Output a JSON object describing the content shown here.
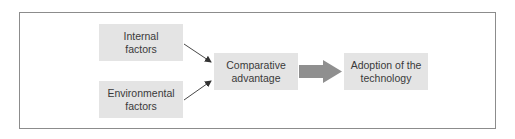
{
  "diagram": {
    "type": "flowchart",
    "nodes": [
      {
        "id": "internal",
        "label": "Internal\nfactors"
      },
      {
        "id": "environmental",
        "label": "Environmental\nfactors"
      },
      {
        "id": "comparative",
        "label": "Comparative\nadvantage"
      },
      {
        "id": "adoption",
        "label": "Adoption of the\ntechnology"
      }
    ],
    "edges": [
      {
        "from": "internal",
        "to": "comparative",
        "style": "thin-arrow"
      },
      {
        "from": "environmental",
        "to": "comparative",
        "style": "thin-arrow"
      },
      {
        "from": "comparative",
        "to": "adoption",
        "style": "block-arrow"
      }
    ],
    "colors": {
      "node_fill": "#e4e4e4",
      "text": "#3a3a3a",
      "frame_border": "#8c8c8c",
      "thin_arrow": "#333333",
      "block_arrow": "#8f8f8f"
    }
  }
}
